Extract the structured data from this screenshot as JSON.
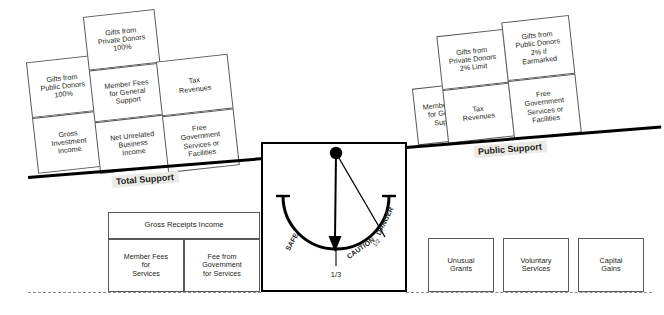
{
  "diagram": {
    "beams": [
      {
        "id": "total-support",
        "label": "Total Support"
      },
      {
        "id": "public-support",
        "label": "Public Support"
      }
    ],
    "left_side": {
      "beam_label": "Total Support",
      "columns": [
        {
          "id": "col-public-donors",
          "cells": [
            {
              "lines": [
                "Gifts from",
                "Public Donors",
                "100%"
              ]
            },
            {
              "lines": [
                "Gross",
                "Investment",
                "Income"
              ]
            }
          ]
        },
        {
          "id": "col-private-donors",
          "cells": [
            {
              "lines": [
                "Gifts from",
                "Private Donors",
                "100%"
              ]
            },
            {
              "lines": [
                "Member Fees",
                "for General",
                "Support"
              ]
            },
            {
              "lines": [
                "Net Unrelated",
                "Business",
                "Income"
              ]
            }
          ]
        },
        {
          "id": "col-tax-revenues",
          "cells": [
            {
              "lines": [
                "Tax",
                "Revenues"
              ]
            },
            {
              "lines": [
                "Free",
                "Government",
                "Services or",
                "Facilities"
              ]
            }
          ]
        }
      ]
    },
    "right_side": {
      "beam_label": "Public Support",
      "columns": [
        {
          "id": "col-member-fees",
          "cells": [
            {
              "lines": [
                "Member Fees",
                "for General",
                "Support"
              ]
            }
          ]
        },
        {
          "id": "col-private-donors-2pct",
          "cells": [
            {
              "lines": [
                "Gifts from",
                "Private Donors",
                "2% Limit"
              ]
            },
            {
              "lines": [
                "Tax",
                "Revenues"
              ]
            }
          ]
        },
        {
          "id": "col-public-donors-earmarked",
          "cells": [
            {
              "lines": [
                "Gifts from",
                "Public Donors",
                "2% if",
                "Earmarked"
              ]
            },
            {
              "lines": [
                "Free",
                "Government",
                "Services or",
                "Facilities"
              ]
            }
          ]
        }
      ]
    },
    "bottom_left_group": {
      "id": "gross-receipts-group",
      "header": {
        "lines": [
          "Gross Receipts Income"
        ]
      },
      "cells": [
        {
          "lines": [
            "Member Fees",
            "for",
            "Services"
          ]
        },
        {
          "lines": [
            "Fee from",
            "Government",
            "for Services"
          ]
        }
      ]
    },
    "bottom_right_boxes": [
      {
        "id": "unusual-grants",
        "lines": [
          "Unusual",
          "Grants"
        ]
      },
      {
        "id": "voluntary-services",
        "lines": [
          "Voluntary",
          "Services"
        ]
      },
      {
        "id": "capital-gains",
        "lines": [
          "Capital",
          "Gains"
        ]
      }
    ],
    "gauge": {
      "id": "support-ratio-gauge",
      "zone_labels": [
        "SAFE",
        "CAUTION",
        "DANGER"
      ],
      "tick_labels": [
        {
          "id": "needle-value",
          "text": "1/3"
        },
        {
          "id": "danger-value",
          "text": "1/2"
        }
      ],
      "needle_points_to": "1/3"
    },
    "colors": {
      "ink": "#231f20",
      "rule": "#58595b",
      "beam": "#000000",
      "label_bg": "#eceae6",
      "dash": "#8c8c8c"
    }
  }
}
